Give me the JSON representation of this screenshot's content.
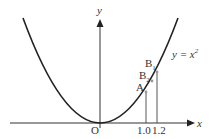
{
  "diagram": {
    "axes": {
      "x_label": "x",
      "y_label": "y",
      "origin_label": "O"
    },
    "curve": {
      "equation_lhs": "y = x",
      "equation_exp": "2"
    },
    "points": [
      {
        "name": "A",
        "sub": ""
      },
      {
        "name": "B",
        "sub": "2"
      },
      {
        "name": "B",
        "sub": "1"
      }
    ],
    "x_ticks": [
      "1.0",
      "1.2"
    ],
    "colors": {
      "curve": "#222222",
      "axes": "#333333",
      "points": "#999999"
    }
  }
}
